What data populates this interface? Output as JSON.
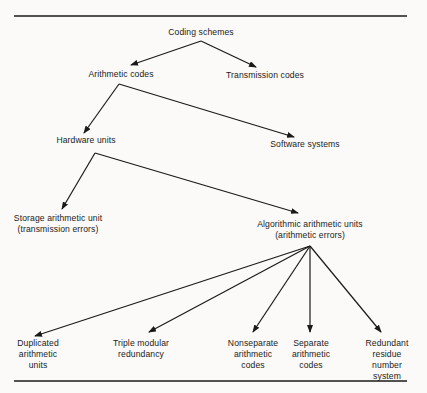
{
  "diagram": {
    "nodes": {
      "root": {
        "lines": [
          "Coding schemes"
        ]
      },
      "arith": {
        "lines": [
          "Arithmetic codes"
        ]
      },
      "trans": {
        "lines": [
          "Transmission codes"
        ]
      },
      "hw": {
        "lines": [
          "Hardware units"
        ]
      },
      "sw": {
        "lines": [
          "Software systems"
        ]
      },
      "storage": {
        "lines": [
          "Storage arithmetic unit",
          "(transmission errors)"
        ]
      },
      "algo": {
        "lines": [
          "Algorithmic arithmetic units",
          "(arithmetic errors)"
        ]
      },
      "dup": {
        "lines": [
          "Duplicated",
          "arithmetic",
          "units"
        ]
      },
      "tmr": {
        "lines": [
          "Triple modular",
          "redundancy"
        ]
      },
      "nonsep": {
        "lines": [
          "Nonseparate",
          "arithmetic",
          "codes"
        ]
      },
      "sep": {
        "lines": [
          "Separate",
          "arithmetic",
          "codes"
        ]
      },
      "rrns": {
        "lines": [
          "Redundant",
          "residue",
          "number",
          "system"
        ]
      }
    },
    "edges": [
      [
        "root",
        "arith"
      ],
      [
        "root",
        "trans"
      ],
      [
        "arith",
        "hw"
      ],
      [
        "arith",
        "sw"
      ],
      [
        "hw",
        "storage"
      ],
      [
        "hw",
        "algo"
      ],
      [
        "algo",
        "dup"
      ],
      [
        "algo",
        "tmr"
      ],
      [
        "algo",
        "nonsep"
      ],
      [
        "algo",
        "sep"
      ],
      [
        "algo",
        "rrns"
      ]
    ],
    "colors": {
      "ink": "#1a1a1a",
      "paper": "#fbfaf8"
    }
  }
}
